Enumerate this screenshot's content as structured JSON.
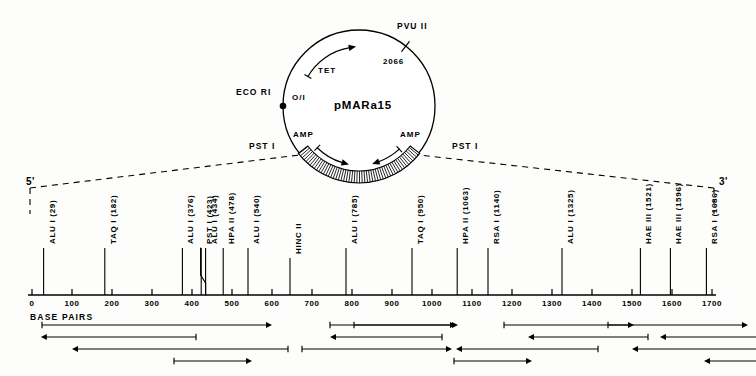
{
  "figure": {
    "ink_color": "#000000",
    "background_color": "#fdfdfb"
  },
  "plasmid": {
    "name": "pMARa15",
    "center_x": 359,
    "center_y": 106,
    "radius": 76,
    "sites": [
      {
        "label": "PVU II",
        "x": 409,
        "y": 27,
        "angle_deg": -52
      },
      {
        "label": "ECO RI",
        "x": 237,
        "y": 92,
        "angle_deg": 185
      },
      {
        "label": "PST I",
        "x": 248,
        "y": 146,
        "angle_deg": 232
      },
      {
        "label": "PST I",
        "x": 453,
        "y": 146,
        "angle_deg": 308
      }
    ],
    "annotations": [
      {
        "label": "2066",
        "x": 385,
        "y": 62
      },
      {
        "label": "O/I",
        "x": 293,
        "y": 98
      },
      {
        "label": "TET",
        "x": 320,
        "y": 70
      },
      {
        "label": "AMP",
        "x": 297,
        "y": 134
      },
      {
        "label": "AMP",
        "x": 404,
        "y": 134
      }
    ],
    "insert_note": "hatched insert arc spans between the two PST I sites at the bottom of the circle"
  },
  "map": {
    "axis": {
      "start_bp": 0,
      "end_bp": 1700,
      "start_x": 32,
      "px_per_bp": 0.4,
      "baseline_y": 295,
      "unit_label": "BASE PAIRS",
      "ticks": [
        0,
        100,
        200,
        300,
        400,
        500,
        600,
        700,
        800,
        900,
        1000,
        1100,
        1200,
        1300,
        1400,
        1500,
        1600,
        1700
      ],
      "tick_labels": [
        "0",
        "100",
        "200",
        "300",
        "400",
        "500",
        "600",
        "700",
        "800",
        "900",
        "1000",
        "1100",
        "1200",
        "1300",
        "1400",
        "1500",
        "1600",
        "1700"
      ]
    },
    "end_markers": {
      "left": "5'",
      "right": "3'"
    },
    "restriction_sites": [
      {
        "label": "ALU I (29)",
        "enzyme": "ALU I",
        "position": 29,
        "stem_top": 248
      },
      {
        "label": "TAQ I (182)",
        "enzyme": "TAQ I",
        "position": 182,
        "stem_top": 248
      },
      {
        "label": "ALU I (376)",
        "enzyme": "ALU I",
        "position": 376,
        "stem_top": 248
      },
      {
        "label": "PST I (423)",
        "enzyme": "PST I",
        "position": 423,
        "stem_top": 248
      },
      {
        "label": "ALU I (434)",
        "enzyme": "ALU I",
        "position": 434,
        "stem_top": 248
      },
      {
        "label": "HPA II (478)",
        "enzyme": "HPA II",
        "position": 478,
        "stem_top": 248
      },
      {
        "label": "ALU I (540)",
        "enzyme": "ALU I",
        "position": 540,
        "stem_top": 248
      },
      {
        "label": "HINC II",
        "enzyme": "HINC II",
        "position": 645,
        "stem_top": 258
      },
      {
        "label": "ALU I (785)",
        "enzyme": "ALU I",
        "position": 785,
        "stem_top": 248
      },
      {
        "label": "TAQ I (950)",
        "enzyme": "TAQ I",
        "position": 950,
        "stem_top": 248
      },
      {
        "label": "HPA II (1063)",
        "enzyme": "HPA II",
        "position": 1063,
        "stem_top": 248
      },
      {
        "label": "RSA I (1140)",
        "enzyme": "RSA I",
        "position": 1140,
        "stem_top": 248
      },
      {
        "label": "ALU I (1325)",
        "enzyme": "ALU I",
        "position": 1325,
        "stem_top": 248
      },
      {
        "label": "HAE III (1521)",
        "enzyme": "HAE III",
        "position": 1521,
        "stem_top": 248
      },
      {
        "label": "HAE III (1596)",
        "enzyme": "HAE III",
        "position": 1596,
        "stem_top": 248
      },
      {
        "label": "RSA I (1686)",
        "enzyme": "RSA I",
        "position": 1686,
        "stem_top": 248
      }
    ]
  },
  "sequencing_arrows": {
    "row_y": [
      325,
      337,
      349,
      361
    ],
    "rows": [
      [
        {
          "from": 25,
          "to": 600,
          "dir": "right"
        },
        {
          "from": 745,
          "to": 1065,
          "dir": "right"
        },
        {
          "from": 805,
          "to": 1060,
          "dir": "right"
        },
        {
          "from": 1180,
          "to": 1505,
          "dir": "right"
        },
        {
          "from": 1440,
          "to": 1790,
          "dir": "right"
        },
        {
          "from": 1860,
          "to": 2180,
          "dir": "right"
        },
        {
          "from": 2265,
          "to": 2440,
          "dir": "right"
        },
        {
          "from": 2435,
          "to": 2680,
          "dir": "right"
        },
        {
          "from": 2670,
          "to": 2720,
          "dir": "right"
        }
      ],
      [
        {
          "from": 22,
          "to": 410,
          "dir": "left"
        },
        {
          "from": 745,
          "to": 1025,
          "dir": "left"
        },
        {
          "from": 1240,
          "to": 1540,
          "dir": "left"
        },
        {
          "from": 1570,
          "to": 1930,
          "dir": "left"
        },
        {
          "from": 2000,
          "to": 2290,
          "dir": "right"
        }
      ],
      [
        {
          "from": 100,
          "to": 640,
          "dir": "left"
        },
        {
          "from": 675,
          "to": 1050,
          "dir": "right"
        },
        {
          "from": 1060,
          "to": 1415,
          "dir": "left"
        },
        {
          "from": 1500,
          "to": 1880,
          "dir": "left"
        },
        {
          "from": 1975,
          "to": 2345,
          "dir": "left"
        },
        {
          "from": 2355,
          "to": 2430,
          "dir": "left"
        }
      ],
      [
        {
          "from": 355,
          "to": 550,
          "dir": "right"
        },
        {
          "from": 1055,
          "to": 1250,
          "dir": "right"
        },
        {
          "from": 1680,
          "to": 1890,
          "dir": "left"
        }
      ]
    ],
    "note": "arrow endpoints are expressed in base pairs along the map axis"
  }
}
